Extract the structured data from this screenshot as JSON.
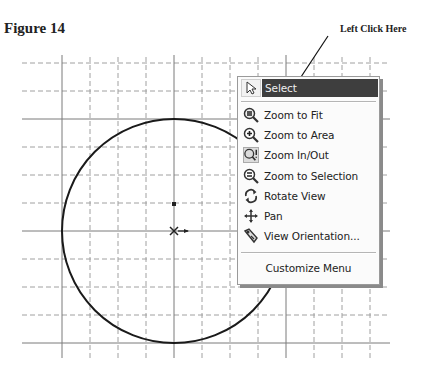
{
  "figure": {
    "title": "Figure 14",
    "callout": "Left Click Here"
  },
  "colors": {
    "grid_solid": "#7a7a7a",
    "grid_dashed": "#9c9c9c",
    "circle": "#1a1a1a",
    "highlight": "#3e3e3e",
    "menu_bg": "#fbfbfb"
  },
  "sketch": {
    "circle_center": [
      174,
      231
    ],
    "circle_radius": 112
  },
  "context_menu": {
    "items": [
      {
        "label": "Select",
        "icon": "cursor-arrow-icon",
        "highlighted": true
      },
      {
        "label": "Zoom to Fit",
        "icon": "zoom-to-fit-icon"
      },
      {
        "label": "Zoom to Area",
        "icon": "zoom-to-area-icon"
      },
      {
        "label": "Zoom In/Out",
        "icon": "zoom-in-out-icon",
        "pressed": true
      },
      {
        "label": "Zoom to Selection",
        "icon": "zoom-to-selection-icon"
      },
      {
        "label": "Rotate View",
        "icon": "rotate-view-icon"
      },
      {
        "label": "Pan",
        "icon": "pan-icon"
      },
      {
        "label": "View Orientation...",
        "icon": "view-orientation-icon"
      }
    ],
    "footer": "Customize Menu"
  }
}
